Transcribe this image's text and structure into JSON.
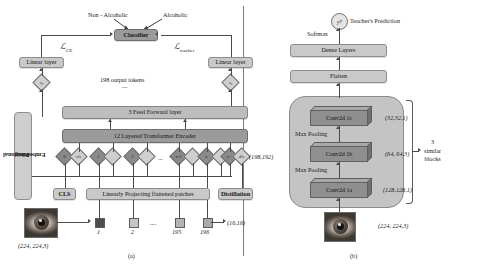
{
  "figure": {
    "panel_a_caption": "(a)",
    "panel_b_caption": "(b)"
  },
  "panel_a": {
    "class_labels": {
      "left": "Non - Alcoholic",
      "right": "Alcoholic"
    },
    "classifier": "Classifier",
    "loss_ce": "ℒ",
    "loss_ce_sub": "CE",
    "loss_teacher": "ℒ",
    "loss_teacher_sub": "teacher",
    "linear_layer_left": "Linear layer",
    "linear_layer_right": "Linear layer",
    "output_tokens_note": "198 output tokens",
    "dots_note": "....",
    "feed_forward": "3 Feed Forward layer",
    "encoder": "12 Layered Transformer Encoder",
    "positional_embedding": "Positional\nEmbedding",
    "positional_embedding_line1": "Positional",
    "positional_embedding_line2": "Embedding",
    "cls_token": "CLS",
    "projection": "Linearly Projecting flattened patches",
    "distillation": "Distillation",
    "token_shape": "(198,192)",
    "patch_shape": "(16,16)",
    "input_shape": "(224, 224,3)",
    "tokens": [
      {
        "label": "0",
        "style": "dark"
      },
      {
        "label": "cls",
        "style": "light"
      },
      {
        "label": "1",
        "style": "dark"
      },
      {
        "label": "",
        "style": "light"
      },
      {
        "label": "2",
        "style": "dark"
      },
      {
        "label": "",
        "style": "light"
      },
      {
        "label": "n-1",
        "style": "dark"
      },
      {
        "label": "",
        "style": "light"
      },
      {
        "label": "n",
        "style": "dark"
      },
      {
        "label": "",
        "style": "light"
      },
      {
        "label": "n+",
        "style": "dark"
      },
      {
        "label": "dis",
        "style": "light"
      }
    ],
    "mid_dots": "...",
    "cls_embed_left": "c₀",
    "cls_embed_right": "c₀",
    "patches": [
      {
        "label": "1"
      },
      {
        "label": "2"
      },
      {
        "label": "195"
      },
      {
        "label": "196"
      }
    ],
    "patch_dots": "...."
  },
  "panel_b": {
    "teacher_node": "y",
    "teacher_node_sub": "T",
    "teacher_prediction": "Teacher's Prediction",
    "softmax": "Softmax",
    "dense_layers": "Dense Layers",
    "flatten": "Flatten",
    "conv_blocks": [
      {
        "name": "Conv2d 1c",
        "shape": "(32,32,1)"
      },
      {
        "name": "Conv2d 1b",
        "shape": "(64, 64,3)"
      },
      {
        "name": "Conv2d 1a",
        "shape": "(128,128,1)"
      }
    ],
    "pooling_labels": [
      "Max Pooling",
      "Max Pooling"
    ],
    "similar_blocks_count": "3",
    "similar_blocks_line1": "3",
    "similar_blocks_line2": "similar",
    "similar_blocks_line3": "blocks",
    "input_shape": "(224, 224,3)"
  },
  "colors": {
    "box_fill": "#c9c9c9",
    "box_dark": "#9b9b9b",
    "line": "#4a4a4a",
    "diamond_dark": "#8a8a8a",
    "diamond_light": "#cfcfcf",
    "background": "#ffffff"
  }
}
